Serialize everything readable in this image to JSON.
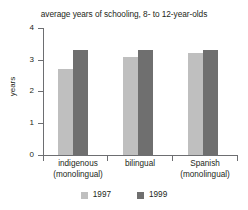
{
  "chart_data": {
    "type": "bar",
    "title": "average years of schooling, 8- to 12-year-olds",
    "xlabel": "",
    "ylabel": "years",
    "ylim": [
      0,
      4
    ],
    "yticks": [
      "0",
      "1",
      "2",
      "3",
      "4"
    ],
    "grid": false,
    "legend_position": "bottom",
    "categories": [
      "indigenous\n(monolingual)",
      "bilingual",
      "Spanish\n(monolingual)"
    ],
    "category_lines": [
      [
        "indigenous",
        "(monolingual)"
      ],
      [
        "bilingual",
        ""
      ],
      [
        "Spanish",
        "(monolingual)"
      ]
    ],
    "series": [
      {
        "name": "1997",
        "color": "#bfbfbf",
        "values": [
          2.7,
          3.1,
          3.2
        ]
      },
      {
        "name": "1999",
        "color": "#6f6f6f",
        "values": [
          3.3,
          3.3,
          3.3
        ]
      }
    ]
  },
  "legend": {
    "items": [
      {
        "label": "1997",
        "color": "#bfbfbf"
      },
      {
        "label": "1999",
        "color": "#6f6f6f"
      }
    ]
  },
  "axis": {
    "y_title": "years",
    "y_tick_labels": [
      "4",
      "3",
      "2",
      "1",
      "0"
    ]
  }
}
